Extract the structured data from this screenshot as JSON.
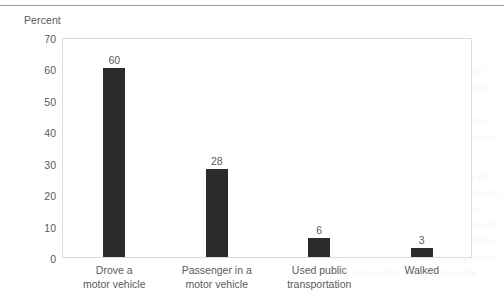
{
  "chart_data": {
    "type": "bar",
    "title": "",
    "subtitle": "",
    "xlabel": "",
    "ylabel": "Percent",
    "ylim": [
      0,
      70
    ],
    "ytick_step": 10,
    "yticks": [
      "70",
      "60",
      "50",
      "40",
      "30",
      "20",
      "10",
      "0"
    ],
    "grid": false,
    "legend": null,
    "categories": [
      "Drove a\nmotor vehicle",
      "Passenger in a\nmotor vehicle",
      "Used public\ntransportation",
      "Walked"
    ],
    "category_lines": [
      [
        "Drove a",
        "motor vehicle"
      ],
      [
        "Passenger in a",
        "motor vehicle"
      ],
      [
        "Used public",
        "transportation"
      ],
      [
        "Walked"
      ]
    ],
    "values": [
      60,
      28,
      6,
      3
    ],
    "value_labels": [
      "60",
      "28",
      "6",
      "3"
    ],
    "bar_color": "#2b2b2b",
    "frame_color": "#dcdcdc",
    "text_color": "#5b5b5b"
  },
  "bleed_text": [
    "the survey of household travel patterns",
    "reported that a majority of respondents",
    "used a private motor vehicle to reach",
    "their destination on the reference day",
    "while public transportation and walking",
    "accounted for a much smaller share of",
    "all reported trips in the same period"
  ]
}
